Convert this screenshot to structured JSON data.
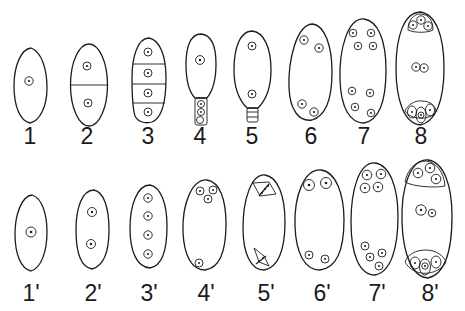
{
  "figure": {
    "background": "#ffffff",
    "ink": "#1c1c1c",
    "top_row": {
      "labels": [
        "1",
        "2",
        "3",
        "4",
        "5",
        "6",
        "7",
        "8"
      ]
    },
    "bottom_row": {
      "labels": [
        "1'",
        "2'",
        "3'",
        "4'",
        "5'",
        "6'",
        "7'",
        "8'"
      ]
    },
    "stages": [
      {
        "id": "1",
        "nuclei": 1,
        "compartments": 1
      },
      {
        "id": "2",
        "nuclei": 2,
        "compartments": 2
      },
      {
        "id": "3",
        "nuclei": 4,
        "compartments": 4
      },
      {
        "id": "4",
        "nuclei": 1,
        "stalk_cells": 3
      },
      {
        "id": "5",
        "nuclei": 2,
        "stalk_cells": 3
      },
      {
        "id": "6",
        "nuclei": 4
      },
      {
        "id": "7",
        "nuclei": 8
      },
      {
        "id": "8",
        "nuclei": 8,
        "note": "clusters at both poles, pair in center"
      },
      {
        "id": "1'",
        "nuclei": 1
      },
      {
        "id": "2'",
        "nuclei": 2
      },
      {
        "id": "3'",
        "nuclei": 4
      },
      {
        "id": "4'",
        "nuclei": 4,
        "note": "three at top, one at bottom"
      },
      {
        "id": "5'",
        "nuclei": 0,
        "note": "two dividing spindles"
      },
      {
        "id": "6'",
        "nuclei": 4
      },
      {
        "id": "7'",
        "nuclei": 8
      },
      {
        "id": "8'",
        "nuclei": 8,
        "note": "clusters at both poles, pair in center"
      }
    ]
  }
}
